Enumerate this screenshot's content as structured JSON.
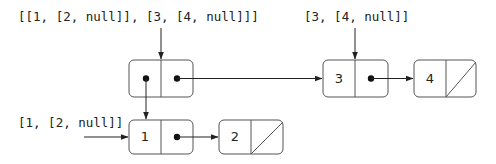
{
  "diagram": {
    "type": "linked-list box-and-pointer",
    "labels": {
      "outer_list": "[[1, [2, null]], [3, [4, null]]]",
      "second_list": "[3, [4, null]]",
      "first_list": "[1, [2, null]]"
    },
    "nodes": [
      {
        "id": "outer-pair",
        "head": "pointer",
        "tail": "pointer"
      },
      {
        "id": "node-3",
        "head": "3",
        "tail": "pointer"
      },
      {
        "id": "node-4",
        "head": "4",
        "tail": "null"
      },
      {
        "id": "node-1",
        "head": "1",
        "tail": "pointer"
      },
      {
        "id": "node-2",
        "head": "2",
        "tail": "null"
      }
    ],
    "edges": [
      {
        "from": "outer_list-label",
        "to": "outer-pair"
      },
      {
        "from": "outer-pair.head",
        "to": "node-1"
      },
      {
        "from": "outer-pair.tail",
        "to": "node-3"
      },
      {
        "from": "second_list-label",
        "to": "node-3"
      },
      {
        "from": "node-3.tail",
        "to": "node-4"
      },
      {
        "from": "first_list-label",
        "to": "node-1"
      },
      {
        "from": "node-1.tail",
        "to": "node-2"
      }
    ],
    "values": {
      "n3": "3",
      "n4": "4",
      "n1": "1",
      "n2": "2"
    },
    "colors": {
      "stroke": "#555555",
      "arrow": "#222222",
      "text": "#222222"
    }
  }
}
